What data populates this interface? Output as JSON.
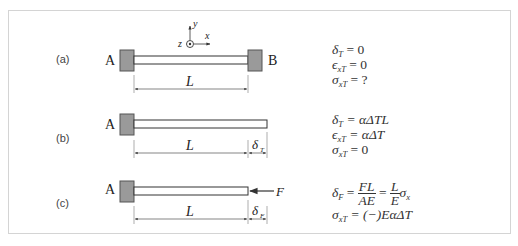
{
  "cases": [
    {
      "id": "a",
      "label": "(a)",
      "left_support": "A",
      "right_support": "B",
      "length_label": "L",
      "axes": {
        "x": "x",
        "y": "y",
        "z": "z"
      },
      "equations": {
        "line1_lhs": "δ",
        "line1_sub": "T",
        "line1_rhs": " = 0",
        "line2_lhs": "ϵ",
        "line2_sub": "xT",
        "line2_rhs": " = 0",
        "line3_lhs": "σ",
        "line3_sub": "xT",
        "line3_rhs": " = ?"
      }
    },
    {
      "id": "b",
      "label": "(b)",
      "left_support": "A",
      "length_label": "L",
      "extension_label": "δ",
      "extension_sub": "T",
      "equations": {
        "line1_lhs": "δ",
        "line1_sub": "T",
        "line1_rhs": " = αΔTL",
        "line2_lhs": "ϵ",
        "line2_sub": "xT",
        "line2_rhs": " = αΔT",
        "line3_lhs": "σ",
        "line3_sub": "xT",
        "line3_rhs": " = 0"
      }
    },
    {
      "id": "c",
      "label": "(c)",
      "left_support": "A",
      "length_label": "L",
      "force_label": "F",
      "extension_label": "δ",
      "extension_sub": "F",
      "equations": {
        "line1_lhs": "δ",
        "line1_sub": "F",
        "line1_eq": " = ",
        "frac1_num": "FL",
        "frac1_den": "AE",
        "line1_eq2": " = ",
        "frac2_num": "L",
        "frac2_den": "E",
        "line1_tail": "σ",
        "line1_tail_sub": "x",
        "line2_lhs": "σ",
        "line2_sub": "xT",
        "line2_rhs": " = (−)EαΔT"
      }
    }
  ],
  "colors": {
    "wall_fill": "#9a9a9a",
    "wall_stroke": "#555555",
    "line": "#333333",
    "frame_border": "#d4d4d4"
  }
}
